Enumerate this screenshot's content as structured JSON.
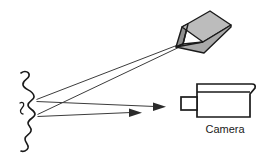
{
  "diagram": {
    "background_color": "#ffffff",
    "width": 270,
    "height": 168,
    "labels": {
      "camera": "Camera"
    },
    "components": [
      {
        "id": "projector",
        "name": "projector",
        "description": "Tilted three-dimensional box representing the light projector",
        "fill_top": "#b9b9b9",
        "fill_front": "#a8a8a8",
        "fill_side": "#8f8f8f",
        "stroke": "#1a1a1a"
      },
      {
        "id": "surface",
        "name": "wavy-surface",
        "description": "Irregular wavy vertical profile of the scanned object surface",
        "stroke": "#1a1a1a"
      },
      {
        "id": "camera",
        "name": "camera",
        "description": "Side view outline of a video camera",
        "fill": "#ffffff",
        "stroke": "#1a1a1a",
        "label": "Camera"
      }
    ],
    "rays": [
      {
        "id": "ray-projector-upper",
        "name": "projector-to-surface-upper",
        "from": "projector",
        "to": "surface",
        "arrow": false,
        "color": "#3c3c3c"
      },
      {
        "id": "ray-projector-lower",
        "name": "projector-to-surface-lower",
        "from": "projector",
        "to": "surface",
        "arrow": false,
        "color": "#3c3c3c"
      },
      {
        "id": "ray-reflect-long",
        "name": "surface-to-camera-long",
        "from": "surface",
        "to": "camera",
        "arrow": true,
        "color": "#3c3c3c"
      },
      {
        "id": "ray-reflect-short",
        "name": "surface-to-camera-short",
        "from": "surface",
        "to": "camera",
        "arrow": true,
        "color": "#3c3c3c"
      }
    ]
  }
}
